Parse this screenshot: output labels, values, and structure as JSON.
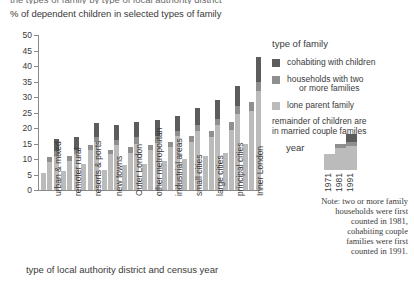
{
  "cropped_heading": "the types of family by type of local authority district",
  "subtitle": "% of dependent children in selected types of family",
  "axis": {
    "x_title": "type of local authority district and census year",
    "y_ticks": [
      "0",
      "5",
      "10",
      "15",
      "20",
      "25",
      "30",
      "35",
      "40",
      "45",
      "50"
    ]
  },
  "legend": {
    "title": "type of family",
    "items": [
      {
        "label": "cohabiting with children",
        "label2": "",
        "color": "#5c5c5c",
        "key": "cohab"
      },
      {
        "label": "households with two",
        "label2": "or more families",
        "color": "#8f8f8f",
        "key": "two"
      },
      {
        "label": "lone parent family",
        "label2": "",
        "color": "#bbbbbb",
        "key": "lone"
      }
    ],
    "remainder_line1": "remainder of children are",
    "remainder_line2": "in married couple familes"
  },
  "year_key": {
    "title": "year",
    "years": [
      "1971",
      "1981",
      "1991"
    ]
  },
  "note": {
    "line1": "Note: two or more family",
    "line2": "households were first",
    "line3": "counted in 1981,",
    "line4": "cohabiting couple",
    "line5": "families were first",
    "line6": "counted in 1991."
  },
  "chart_data": {
    "type": "bar",
    "title": "% of dependent children in selected types of family",
    "subtitle": "",
    "xlabel": "type of local authority district and census year",
    "ylabel": "% of dependent children",
    "ylim": [
      0,
      50
    ],
    "ytick_step": 5,
    "grid": false,
    "legend_position": "right",
    "stacked": true,
    "categories": [
      "urban & mixed",
      "remoter rural",
      "resorts & ports",
      "new towns",
      "Outer London",
      "other metropolitan",
      "industrial areas",
      "small cities",
      "large cities",
      "principal cities",
      "Inner London"
    ],
    "census_years": [
      "1971",
      "1981",
      "1991"
    ],
    "series": [
      {
        "name": "lone parent family",
        "color": "#bbbbbb"
      },
      {
        "name": "households with two or more families",
        "color": "#8f8f8f"
      },
      {
        "name": "cohabiting with children",
        "color": "#5c5c5c"
      }
    ],
    "groups": [
      {
        "category": "urban & mixed",
        "bars": [
          {
            "year": "1971",
            "lone": 5.5,
            "two": 0,
            "cohab": 0
          },
          {
            "year": "1981",
            "lone": 9.0,
            "two": 1.5,
            "cohab": 0
          },
          {
            "year": "1991",
            "lone": 11.0,
            "two": 1.5,
            "cohab": 4.0
          }
        ]
      },
      {
        "category": "remoter rural",
        "bars": [
          {
            "year": "1971",
            "lone": 6.0,
            "two": 0,
            "cohab": 0
          },
          {
            "year": "1981",
            "lone": 9.5,
            "two": 1.5,
            "cohab": 0
          },
          {
            "year": "1991",
            "lone": 11.5,
            "two": 1.5,
            "cohab": 4.0
          }
        ]
      },
      {
        "category": "resorts & ports",
        "bars": [
          {
            "year": "1971",
            "lone": 8.5,
            "two": 0,
            "cohab": 0
          },
          {
            "year": "1981",
            "lone": 13.0,
            "two": 1.5,
            "cohab": 0
          },
          {
            "year": "1991",
            "lone": 15.5,
            "two": 1.5,
            "cohab": 4.5
          }
        ]
      },
      {
        "category": "new towns",
        "bars": [
          {
            "year": "1971",
            "lone": 6.5,
            "two": 0,
            "cohab": 0
          },
          {
            "year": "1981",
            "lone": 11.5,
            "two": 1.5,
            "cohab": 0
          },
          {
            "year": "1991",
            "lone": 14.5,
            "two": 1.5,
            "cohab": 5.0
          }
        ]
      },
      {
        "category": "Outer London",
        "bars": [
          {
            "year": "1971",
            "lone": 8.0,
            "two": 0,
            "cohab": 0
          },
          {
            "year": "1981",
            "lone": 12.0,
            "two": 2.0,
            "cohab": 0
          },
          {
            "year": "1991",
            "lone": 15.0,
            "two": 2.0,
            "cohab": 5.0
          }
        ]
      },
      {
        "category": "other metropolitan",
        "bars": [
          {
            "year": "1971",
            "lone": 8.5,
            "two": 0,
            "cohab": 0
          },
          {
            "year": "1981",
            "lone": 13.0,
            "two": 1.5,
            "cohab": 0
          },
          {
            "year": "1991",
            "lone": 16.0,
            "two": 1.5,
            "cohab": 5.0
          }
        ]
      },
      {
        "category": "industrial areas",
        "bars": [
          {
            "year": "1971",
            "lone": 9.5,
            "two": 0,
            "cohab": 0
          },
          {
            "year": "1981",
            "lone": 14.0,
            "two": 1.5,
            "cohab": 0
          },
          {
            "year": "1991",
            "lone": 17.5,
            "two": 1.5,
            "cohab": 5.0
          }
        ]
      },
      {
        "category": "small cities",
        "bars": [
          {
            "year": "1971",
            "lone": 10.0,
            "two": 0,
            "cohab": 0
          },
          {
            "year": "1981",
            "lone": 15.5,
            "two": 2.0,
            "cohab": 0
          },
          {
            "year": "1991",
            "lone": 19.0,
            "two": 2.0,
            "cohab": 5.5
          }
        ]
      },
      {
        "category": "large cities",
        "bars": [
          {
            "year": "1971",
            "lone": 11.0,
            "two": 0,
            "cohab": 0
          },
          {
            "year": "1981",
            "lone": 17.0,
            "two": 2.0,
            "cohab": 0
          },
          {
            "year": "1991",
            "lone": 21.0,
            "two": 2.0,
            "cohab": 6.0
          }
        ]
      },
      {
        "category": "principal cities",
        "bars": [
          {
            "year": "1971",
            "lone": 12.0,
            "two": 0,
            "cohab": 0
          },
          {
            "year": "1981",
            "lone": 19.5,
            "two": 2.5,
            "cohab": 0
          },
          {
            "year": "1991",
            "lone": 24.5,
            "two": 2.5,
            "cohab": 6.5
          }
        ]
      },
      {
        "category": "Inner London",
        "bars": [
          {
            "year": "1971",
            "lone": 15.0,
            "two": 0,
            "cohab": 0
          },
          {
            "year": "1981",
            "lone": 25.5,
            "two": 3.0,
            "cohab": 0
          },
          {
            "year": "1991",
            "lone": 32.0,
            "two": 3.0,
            "cohab": 8.0
          }
        ]
      }
    ]
  }
}
